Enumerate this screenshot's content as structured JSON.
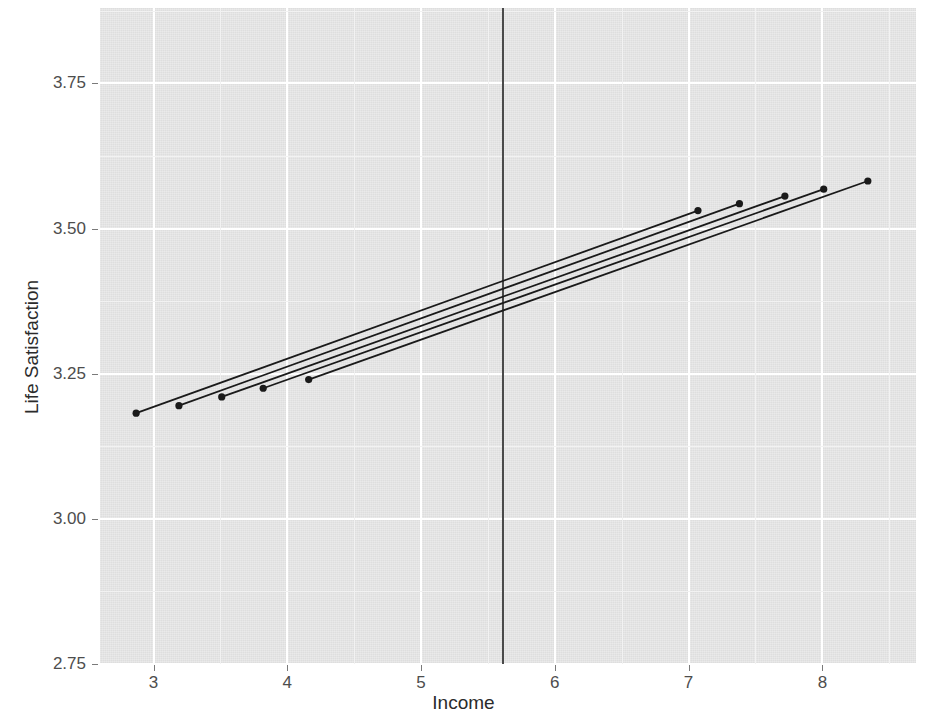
{
  "chart_data": {
    "type": "line",
    "title": "",
    "subtitle": "",
    "xlabel": "Income",
    "ylabel": "Life Satisfaction",
    "xlim": [
      2.6,
      8.7
    ],
    "ylim": [
      2.75,
      3.88
    ],
    "xticks": [
      3,
      4,
      5,
      6,
      7,
      8
    ],
    "xticklabels": [
      "3",
      "4",
      "5",
      "6",
      "7",
      "8"
    ],
    "yticks": [
      2.75,
      3.0,
      3.25,
      3.5,
      3.75
    ],
    "yticklabels": [
      "2.75",
      "3.00",
      "3.25",
      "3.50",
      "3.75"
    ],
    "grid": true,
    "grid_major_color": "#ffffff",
    "grid_minor_color": "#f2f2f2",
    "panel_background": "#dedede",
    "legend": "none",
    "line_color": "#1a1a1a",
    "point_color": "#1a1a1a",
    "annotations": [
      {
        "name": "vertical-reference-line",
        "type": "vline",
        "x": 5.61,
        "color": "#4a4a4a"
      }
    ],
    "series": [
      {
        "name": "line-1",
        "x": [
          2.87,
          7.07
        ],
        "y": [
          3.182,
          3.531
        ],
        "endpoint_markers": [
          {
            "x": 2.87,
            "y": 3.182
          },
          {
            "x": 7.07,
            "y": 3.531
          }
        ]
      },
      {
        "name": "line-2",
        "x": [
          3.19,
          7.38
        ],
        "y": [
          3.195,
          3.543
        ],
        "endpoint_markers": [
          {
            "x": 3.19,
            "y": 3.195
          },
          {
            "x": 7.38,
            "y": 3.543
          }
        ]
      },
      {
        "name": "line-3",
        "x": [
          3.51,
          7.72
        ],
        "y": [
          3.21,
          3.556
        ],
        "endpoint_markers": [
          {
            "x": 3.51,
            "y": 3.21
          },
          {
            "x": 7.72,
            "y": 3.556
          }
        ]
      },
      {
        "name": "line-4",
        "x": [
          3.82,
          8.01
        ],
        "y": [
          3.225,
          3.568
        ],
        "endpoint_markers": [
          {
            "x": 3.82,
            "y": 3.225
          },
          {
            "x": 8.01,
            "y": 3.568
          }
        ]
      },
      {
        "name": "line-5",
        "x": [
          4.16,
          8.34
        ],
        "y": [
          3.24,
          3.582
        ],
        "endpoint_markers": [
          {
            "x": 4.16,
            "y": 3.24
          },
          {
            "x": 8.34,
            "y": 3.582
          }
        ]
      }
    ]
  }
}
